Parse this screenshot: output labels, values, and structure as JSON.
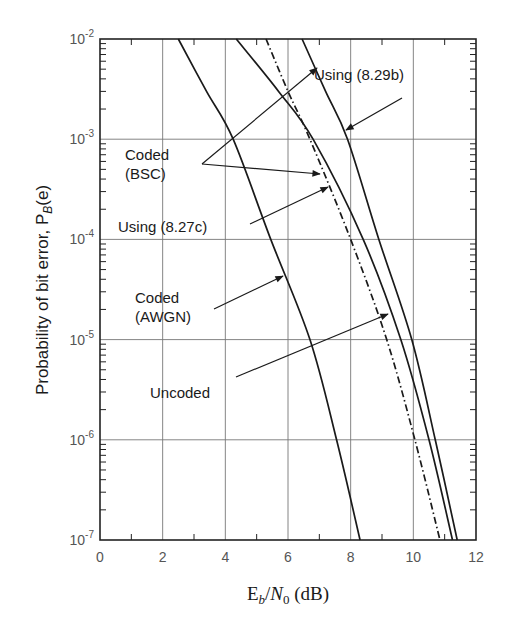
{
  "chart_data": {
    "type": "line",
    "title": "",
    "xlabel": "E_b/N_0 (dB)",
    "xlabel_parts": {
      "e": "E",
      "b": "b",
      "slash": "/",
      "n": "N",
      "zero": "0",
      "unit": " (dB)"
    },
    "ylabel": "Probability of bit error, P_B(e)",
    "ylabel_parts": {
      "prefix": "Probability of bit error, P",
      "sub": "B",
      "suffix": "(e)"
    },
    "xlim": [
      0,
      12
    ],
    "ylim": [
      1e-07,
      0.01
    ],
    "yscale": "log",
    "grid": true,
    "x_ticks": [
      "0",
      "2",
      "4",
      "6",
      "8",
      "10",
      "12"
    ],
    "y_ticks": [
      {
        "base": "10",
        "exp": "-2",
        "value": 0.01
      },
      {
        "base": "10",
        "exp": "-3",
        "value": 0.001
      },
      {
        "base": "10",
        "exp": "-4",
        "value": 0.0001
      },
      {
        "base": "10",
        "exp": "-5",
        "value": 1e-05
      },
      {
        "base": "10",
        "exp": "-6",
        "value": 1e-06
      },
      {
        "base": "10",
        "exp": "-7",
        "value": 1e-07
      }
    ],
    "series": [
      {
        "name": "Uncoded",
        "style": "solid",
        "points": [
          [
            2.5,
            0.01
          ],
          [
            3.4,
            0.003
          ],
          [
            4.25,
            0.001
          ],
          [
            5.45,
            0.0001
          ],
          [
            6.7,
            1e-05
          ],
          [
            7.55,
            1e-06
          ],
          [
            8.3,
            1e-07
          ]
        ]
      },
      {
        "name": "Coded (AWGN)",
        "style": "dashdot",
        "points": [
          [
            5.3,
            0.01
          ],
          [
            6.0,
            0.003
          ],
          [
            6.7,
            0.001
          ],
          [
            8.0,
            0.0001
          ],
          [
            9.15,
            1e-05
          ],
          [
            10.05,
            1e-06
          ],
          [
            10.85,
            1e-07
          ]
        ]
      },
      {
        "name": "Coded (BSC) Using (8.27c)",
        "style": "solid",
        "points": [
          [
            4.35,
            0.01
          ],
          [
            5.7,
            0.003
          ],
          [
            6.8,
            0.001
          ],
          [
            8.4,
            0.0001
          ],
          [
            9.6,
            1e-05
          ],
          [
            10.5,
            1e-06
          ],
          [
            11.25,
            1e-07
          ]
        ]
      },
      {
        "name": "Coded (BSC) Using (8.29b)",
        "style": "solid",
        "points": [
          [
            6.45,
            0.01
          ],
          [
            7.2,
            0.003
          ],
          [
            7.9,
            0.001
          ],
          [
            8.9,
            0.0001
          ],
          [
            9.95,
            1e-05
          ],
          [
            10.7,
            1e-06
          ],
          [
            11.4,
            1e-07
          ]
        ]
      }
    ],
    "annotations": [
      {
        "text": "Using (8.29b)",
        "x": 314,
        "y": 80,
        "arrow_from": [
          402,
          98
        ],
        "arrow_to": [
          346,
          130
        ]
      },
      {
        "text": "Coded",
        "text2": "(BSC)",
        "x": 125,
        "y": 160,
        "arrow_from": [
          202,
          164
        ],
        "arrow_to": [
          317,
          68
        ],
        "arrow2_from": [
          202,
          164
        ],
        "arrow2_to": [
          320,
          174
        ]
      },
      {
        "text": "Using (8.27c)",
        "x": 118,
        "y": 232,
        "arrow_from": [
          250,
          224
        ],
        "arrow_to": [
          328,
          187
        ]
      },
      {
        "text": "Coded",
        "text2": "(AWGN)",
        "x": 135,
        "y": 303,
        "arrow_from": [
          214,
          309
        ],
        "arrow_to": [
          283,
          276
        ]
      },
      {
        "text": "Uncoded",
        "x": 150,
        "y": 398,
        "arrow_from": [
          236,
          377
        ],
        "arrow_to": [
          388,
          314
        ]
      }
    ]
  },
  "colors": {
    "line": "#1a1a1a",
    "grid": "#777777",
    "axis": "#222222",
    "tick_text": "#555555",
    "background": "#ffffff"
  }
}
